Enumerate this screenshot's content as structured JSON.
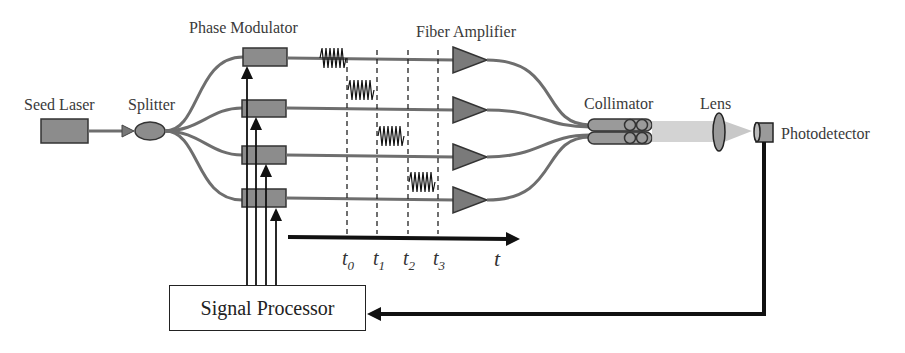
{
  "diagram": {
    "type": "coherent beam combining system schematic",
    "labels": {
      "seed_laser": "Seed Laser",
      "splitter": "Splitter",
      "phase_modulator": "Phase Modulator",
      "fiber_amplifier": "Fiber Amplifier",
      "collimator": "Collimator",
      "lens": "Lens",
      "photodetector": "Photodetector",
      "signal_processor": "Signal Processor"
    },
    "time_axis": {
      "ticks": [
        {
          "base": "t",
          "sub": "0"
        },
        {
          "base": "t",
          "sub": "1"
        },
        {
          "base": "t",
          "sub": "2"
        },
        {
          "base": "t",
          "sub": "3"
        }
      ],
      "axis_label": "t"
    },
    "channels": 4,
    "colors": {
      "component_fill": "#8c8c8c",
      "fiber": "#6e6e6e",
      "line": "#111111",
      "beam": "#c8c8c8"
    }
  }
}
